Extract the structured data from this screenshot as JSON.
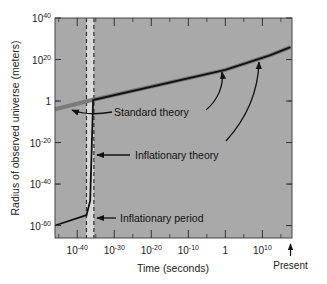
{
  "chart_data": {
    "type": "line",
    "title": "",
    "xlabel": "Time (seconds)",
    "ylabel": "Radius of observed universe (meters)",
    "x_scale": "log10",
    "y_scale": "log10",
    "xlim_exp": [
      -46,
      18
    ],
    "ylim_exp": [
      -66,
      40
    ],
    "x_ticks": [
      {
        "exp": -40,
        "base": "10",
        "sup": "-40"
      },
      {
        "exp": -30,
        "base": "10",
        "sup": "-30"
      },
      {
        "exp": -20,
        "base": "10",
        "sup": "-20"
      },
      {
        "exp": -10,
        "base": "10",
        "sup": "-10"
      },
      {
        "exp": 0,
        "base": "1",
        "sup": ""
      },
      {
        "exp": 10,
        "base": "10",
        "sup": "10"
      }
    ],
    "y_ticks": [
      {
        "exp": 40,
        "base": "10",
        "sup": "40"
      },
      {
        "exp": 20,
        "base": "10",
        "sup": "20"
      },
      {
        "exp": 0,
        "base": "1",
        "sup": ""
      },
      {
        "exp": -20,
        "base": "10",
        "sup": "-20"
      },
      {
        "exp": -40,
        "base": "10",
        "sup": "-40"
      },
      {
        "exp": -60,
        "base": "10",
        "sup": "-60"
      }
    ],
    "present_marker": {
      "label": "Present",
      "x_exp": 17.6
    },
    "inflationary_period": {
      "x_exp_start": -37.5,
      "x_exp_end": -35.5
    },
    "series": [
      {
        "name": "Standard theory",
        "color": "#7a7a7a",
        "points_exp": [
          [
            -46,
            -4
          ],
          [
            -36,
            0.5
          ],
          [
            0,
            15
          ],
          [
            12,
            22
          ],
          [
            17.6,
            26
          ]
        ]
      },
      {
        "name": "Inflationary theory",
        "color": "#111111",
        "points_exp": [
          [
            -46,
            -60
          ],
          [
            -37.5,
            -55
          ],
          [
            -36.5,
            -48
          ],
          [
            -35.7,
            0.5
          ],
          [
            0,
            15
          ],
          [
            12,
            22
          ],
          [
            17.6,
            26
          ]
        ]
      }
    ],
    "annotations": [
      {
        "text": "Standard theory",
        "points_to": "standard theory curves (early and late)"
      },
      {
        "text": "Inflationary theory",
        "points_to": "inflationary curve (vertical rise and late segment)"
      },
      {
        "text": "Inflationary period",
        "points_to": "shaded band"
      }
    ],
    "grid": false,
    "legend": "none (inline annotations)",
    "plot_background": "#a9a9a9",
    "band_color": "#d9d9d9"
  }
}
